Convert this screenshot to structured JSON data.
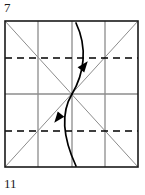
{
  "figure": {
    "type": "origami-crease-diagram",
    "step_number_top": "7",
    "step_number_bottom": "11",
    "square": {
      "x": 5,
      "y": 21,
      "width": 133,
      "height": 146
    },
    "colors": {
      "paper_edge": "#1a1a1a",
      "crease_line": "#8c8c8c",
      "fold_line_dashed": "#000000",
      "arrow": "#000000",
      "background": "#ffffff",
      "text": "#1a1a1a"
    },
    "edges": {
      "name": "paper-square-outline",
      "stroke_width": 1.6
    },
    "grid_lines_vertical": [
      {
        "name": "crease-vertical-left-quarter",
        "x": 38
      },
      {
        "name": "crease-vertical-center",
        "x": 72
      },
      {
        "name": "crease-vertical-right-quarter",
        "x": 105
      }
    ],
    "grid_lines_horizontal": [
      {
        "name": "crease-horizontal-center",
        "y": 94
      }
    ],
    "dashed_lines": [
      {
        "name": "fold-line-upper-quarter",
        "y": 58,
        "x1": 5,
        "x2": 138,
        "dash": "7 5"
      },
      {
        "name": "fold-line-lower-quarter",
        "y": 131,
        "x1": 5,
        "x2": 138,
        "dash": "7 5"
      }
    ],
    "diagonals": [
      {
        "name": "crease-diagonal-tl-br",
        "x1": 5,
        "y1": 21,
        "x2": 138,
        "y2": 167
      },
      {
        "name": "crease-diagonal-bl-tr",
        "x1": 5,
        "y1": 167,
        "x2": 138,
        "y2": 21
      }
    ],
    "arrows": [
      {
        "name": "fold-arrow-upper",
        "direction": "northeast",
        "path": "M 76 23 C 88 48, 84 74, 72 94",
        "head_at": [
          84,
          66
        ],
        "head_angle_deg": -52
      },
      {
        "name": "fold-arrow-lower",
        "direction": "southwest",
        "path": "M 72 94 C 60 114, 64 140, 76 166",
        "head_at": [
          58,
          118
        ],
        "head_angle_deg": 128
      }
    ],
    "center_point": {
      "name": "center-crease-intersection",
      "x": 72,
      "y": 94
    }
  }
}
